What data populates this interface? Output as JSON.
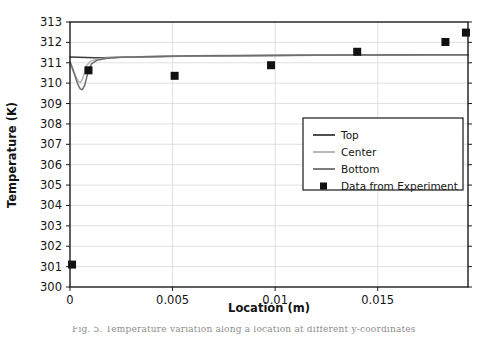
{
  "figure": {
    "caption_partial": "Fig. 5. Temperature variation along a location at different y-coordinates"
  },
  "chart_data": {
    "type": "line",
    "title": "",
    "xlabel": "Location (m)",
    "ylabel": "Temperature (K)",
    "xlim": [
      0,
      0.0194
    ],
    "ylim": [
      300,
      313
    ],
    "xticks": [
      0,
      0.005,
      0.01,
      0.015
    ],
    "xticklabels": [
      "0",
      "0.005",
      "0.01",
      "0.015"
    ],
    "yticks": [
      300,
      301,
      302,
      303,
      304,
      305,
      306,
      307,
      308,
      309,
      310,
      311,
      312,
      313
    ],
    "yticklabels": [
      "300",
      "301",
      "302",
      "303",
      "304",
      "305",
      "306",
      "307",
      "308",
      "309",
      "310",
      "311",
      "312",
      "313"
    ],
    "grid": true,
    "legend_position": "center-right",
    "colors": {
      "top": "#3b3b3b",
      "center": "#b4b4b4",
      "bottom": "#6e6e6e",
      "experiment": "#111111",
      "grid": "#d8d8d8",
      "frame": "#1a1a1a"
    },
    "series": [
      {
        "name": "Top",
        "kind": "line",
        "color": "#3b3b3b",
        "points": [
          [
            0.0,
            311.28
          ],
          [
            0.0004,
            311.27
          ],
          [
            0.0008,
            311.26
          ],
          [
            0.0012,
            311.25
          ],
          [
            0.0016,
            311.25
          ],
          [
            0.002,
            311.26
          ],
          [
            0.003,
            311.28
          ],
          [
            0.004,
            311.3
          ],
          [
            0.006,
            311.33
          ],
          [
            0.008,
            311.35
          ],
          [
            0.01,
            311.36
          ],
          [
            0.012,
            311.37
          ],
          [
            0.014,
            311.38
          ],
          [
            0.016,
            311.38
          ],
          [
            0.018,
            311.39
          ],
          [
            0.0194,
            311.39
          ]
        ]
      },
      {
        "name": "Center",
        "kind": "line",
        "color": "#b4b4b4",
        "points": [
          [
            0.0,
            310.9
          ],
          [
            0.0001,
            310.72
          ],
          [
            0.0002,
            310.5
          ],
          [
            0.0003,
            310.28
          ],
          [
            0.0004,
            310.1
          ],
          [
            0.0005,
            310.02
          ],
          [
            0.0006,
            310.18
          ],
          [
            0.0007,
            310.5
          ],
          [
            0.0008,
            310.85
          ],
          [
            0.001,
            311.08
          ],
          [
            0.0013,
            311.18
          ],
          [
            0.0018,
            311.24
          ],
          [
            0.0025,
            311.28
          ],
          [
            0.004,
            311.31
          ],
          [
            0.006,
            311.34
          ],
          [
            0.009,
            311.36
          ],
          [
            0.013,
            311.38
          ],
          [
            0.017,
            311.39
          ],
          [
            0.0194,
            311.39
          ]
        ]
      },
      {
        "name": "Bottom",
        "kind": "line",
        "color": "#6e6e6e",
        "points": [
          [
            0.0,
            311.05
          ],
          [
            0.0001,
            310.8
          ],
          [
            0.0002,
            310.5
          ],
          [
            0.0003,
            310.18
          ],
          [
            0.0004,
            309.9
          ],
          [
            0.0005,
            309.72
          ],
          [
            0.0006,
            309.68
          ],
          [
            0.0007,
            309.85
          ],
          [
            0.0008,
            310.22
          ],
          [
            0.0009,
            310.62
          ],
          [
            0.00105,
            310.95
          ],
          [
            0.0013,
            311.12
          ],
          [
            0.0018,
            311.22
          ],
          [
            0.0025,
            311.27
          ],
          [
            0.004,
            311.31
          ],
          [
            0.006,
            311.34
          ],
          [
            0.009,
            311.36
          ],
          [
            0.013,
            311.38
          ],
          [
            0.017,
            311.39
          ],
          [
            0.0194,
            311.39
          ]
        ]
      },
      {
        "name": "Data from Experiment",
        "kind": "scatter",
        "color": "#111111",
        "marker": "square",
        "points": [
          [
            0.0001,
            301.1
          ],
          [
            0.0009,
            310.63
          ],
          [
            0.0051,
            310.36
          ],
          [
            0.0098,
            310.88
          ],
          [
            0.014,
            311.54
          ],
          [
            0.0183,
            312.02
          ],
          [
            0.0193,
            312.48
          ]
        ]
      }
    ],
    "legend_entries": [
      {
        "label": "Top",
        "type": "line",
        "color": "#3b3b3b"
      },
      {
        "label": "Center",
        "type": "line",
        "color": "#b4b4b4"
      },
      {
        "label": "Bottom",
        "type": "line",
        "color": "#6e6e6e"
      },
      {
        "label": "Data from Experiment",
        "type": "marker",
        "color": "#111111"
      }
    ]
  }
}
